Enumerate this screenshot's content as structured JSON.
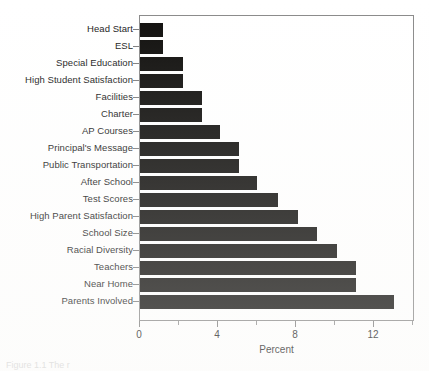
{
  "figure": {
    "caption": "Figure 1.1 The r"
  },
  "chart_data": {
    "type": "bar",
    "orientation": "horizontal",
    "title": "",
    "xlabel": "Percent",
    "ylabel": "",
    "xlim": [
      0,
      14.1
    ],
    "xticks": [
      0,
      4,
      8,
      12
    ],
    "xtick_labels": [
      "0",
      "4",
      "8",
      "12"
    ],
    "xminorticks": [
      2,
      6,
      10,
      14
    ],
    "grid": false,
    "legend": null,
    "bar_color": "#100f0d",
    "frame_color": "#8a8a8a",
    "categories": [
      "Head Start",
      "ESL",
      "Special Education",
      "High Student Satisfaction",
      "Facilities",
      "Charter",
      "AP Courses",
      "Principal's Message",
      "Public Transportation",
      "After School",
      "Test Scores",
      "High Parent Satisfaction",
      "School Size",
      "Racial Diversity",
      "Teachers",
      "Near Home",
      "Parents Involved"
    ],
    "values": [
      1.2,
      1.2,
      2.2,
      2.2,
      3.2,
      3.2,
      4.1,
      5.1,
      5.1,
      6.0,
      7.1,
      8.1,
      9.1,
      10.1,
      11.1,
      11.1,
      13.0
    ]
  }
}
